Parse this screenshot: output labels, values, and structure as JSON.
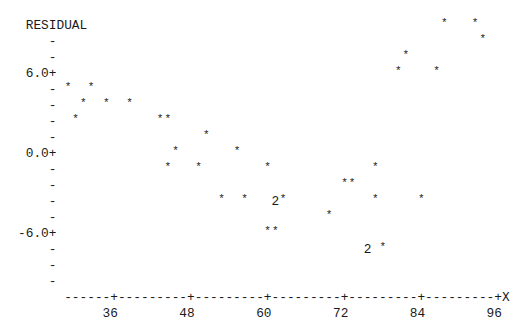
{
  "chart_data": {
    "type": "scatter",
    "title": "",
    "ylabel": "RESIDUAL",
    "xlabel": "X",
    "x_ticks": [
      36,
      48,
      60,
      72,
      84,
      96
    ],
    "y_ticks": [
      6.0,
      0.0,
      -6.0
    ],
    "y_tick_labels": [
      "6.0+",
      "0.0+",
      "-6.0+"
    ],
    "xlim": [
      28.8,
      97.2
    ],
    "ylim": [
      -8.4,
      9.6
    ],
    "grid": false,
    "marker": "*",
    "multiplicity_note": "'2' indicates two coincident observations",
    "points": [
      {
        "x": 87.6,
        "y": 9.6
      },
      {
        "x": 92.4,
        "y": 9.6
      },
      {
        "x": 93.6,
        "y": 8.4
      },
      {
        "x": 81.6,
        "y": 7.2
      },
      {
        "x": 80.4,
        "y": 6.0
      },
      {
        "x": 86.4,
        "y": 6.0
      },
      {
        "x": 28.8,
        "y": 4.8
      },
      {
        "x": 32.4,
        "y": 4.8
      },
      {
        "x": 31.2,
        "y": 3.6
      },
      {
        "x": 34.8,
        "y": 3.6
      },
      {
        "x": 38.4,
        "y": 3.6
      },
      {
        "x": 30.0,
        "y": 2.4
      },
      {
        "x": 43.2,
        "y": 2.4
      },
      {
        "x": 44.4,
        "y": 2.4
      },
      {
        "x": 50.4,
        "y": 1.2
      },
      {
        "x": 45.6,
        "y": 0.0
      },
      {
        "x": 55.2,
        "y": 0.0
      },
      {
        "x": 44.4,
        "y": -1.2
      },
      {
        "x": 49.2,
        "y": -1.2
      },
      {
        "x": 60.0,
        "y": -1.2
      },
      {
        "x": 76.8,
        "y": -1.2
      },
      {
        "x": 72.0,
        "y": -2.4
      },
      {
        "x": 73.2,
        "y": -2.4
      },
      {
        "x": 52.8,
        "y": -3.6
      },
      {
        "x": 56.4,
        "y": -3.6
      },
      {
        "x": 61.2,
        "y": -3.6,
        "count": 2
      },
      {
        "x": 62.4,
        "y": -3.6
      },
      {
        "x": 76.8,
        "y": -3.6
      },
      {
        "x": 84.0,
        "y": -3.6
      },
      {
        "x": 69.6,
        "y": -4.8
      },
      {
        "x": 60.0,
        "y": -6.0
      },
      {
        "x": 61.2,
        "y": -6.0
      },
      {
        "x": 75.6,
        "y": -7.2,
        "count": 2
      },
      {
        "x": 78.0,
        "y": -7.2
      }
    ]
  },
  "plot": {
    "origin_x": 68,
    "col_width": 7.68,
    "row0_y": 18,
    "row_height": 16,
    "rows": [
      {
        "left": [
          [
            -5,
            "RESIDUAL"
          ]
        ],
        "marks": [
          [
            49,
            "*"
          ],
          [
            53,
            "*"
          ]
        ]
      },
      {
        "left": [
          [
            -2,
            "-"
          ]
        ],
        "marks": [
          [
            54,
            "*"
          ]
        ]
      },
      {
        "left": [
          [
            -2,
            "-"
          ]
        ],
        "marks": [
          [
            44,
            "*"
          ]
        ]
      },
      {
        "left": [
          [
            -5,
            "6.0+"
          ]
        ],
        "marks": [
          [
            43,
            "*"
          ],
          [
            48,
            "*"
          ]
        ]
      },
      {
        "left": [
          [
            -2,
            "-"
          ]
        ],
        "marks": [
          [
            0,
            "*"
          ],
          [
            3,
            "*"
          ]
        ]
      },
      {
        "left": [
          [
            -2,
            "-"
          ]
        ],
        "marks": [
          [
            2,
            "*"
          ],
          [
            5,
            "*"
          ],
          [
            8,
            "*"
          ]
        ]
      },
      {
        "left": [
          [
            -2,
            "-"
          ]
        ],
        "marks": [
          [
            1,
            "*"
          ],
          [
            12,
            "*"
          ],
          [
            13,
            "*"
          ]
        ]
      },
      {
        "left": [
          [
            -2,
            "-"
          ]
        ],
        "marks": [
          [
            18,
            "*"
          ]
        ]
      },
      {
        "left": [
          [
            -5,
            "0.0+"
          ]
        ],
        "marks": [
          [
            14,
            "*"
          ],
          [
            22,
            "*"
          ]
        ]
      },
      {
        "left": [
          [
            -2,
            "-"
          ]
        ],
        "marks": [
          [
            13,
            "*"
          ],
          [
            17,
            "*"
          ],
          [
            26,
            "*"
          ],
          [
            40,
            "*"
          ]
        ]
      },
      {
        "left": [
          [
            -2,
            "-"
          ]
        ],
        "marks": [
          [
            36,
            "*"
          ],
          [
            37,
            "*"
          ]
        ]
      },
      {
        "left": [
          [
            -2,
            "-"
          ]
        ],
        "marks": [
          [
            20,
            "*"
          ],
          [
            23,
            "*"
          ],
          [
            27,
            "2"
          ],
          [
            28,
            "*"
          ],
          [
            40,
            "*"
          ],
          [
            46,
            "*"
          ]
        ]
      },
      {
        "left": [
          [
            -2,
            "-"
          ]
        ],
        "marks": [
          [
            34,
            "*"
          ]
        ]
      },
      {
        "left": [
          [
            -6,
            "-6.0+"
          ]
        ],
        "marks": [
          [
            26,
            "*"
          ],
          [
            27,
            "*"
          ]
        ]
      },
      {
        "left": [
          [
            -2,
            "-"
          ]
        ],
        "marks": [
          [
            39,
            "2"
          ],
          [
            41,
            "*"
          ]
        ]
      },
      {
        "left": [
          [
            -2,
            "-"
          ]
        ],
        "marks": []
      },
      {
        "left": [
          [
            -2,
            "-"
          ]
        ],
        "marks": []
      },
      {
        "left": [
          [
            0,
            "------+---------+---------+---------+---------+---------+X"
          ]
        ],
        "marks": []
      },
      {
        "left": [
          [
            5,
            "36"
          ],
          [
            15,
            "48"
          ],
          [
            25,
            "60"
          ],
          [
            35,
            "72"
          ],
          [
            45,
            "84"
          ],
          [
            55,
            "96"
          ]
        ],
        "marks": []
      }
    ]
  }
}
